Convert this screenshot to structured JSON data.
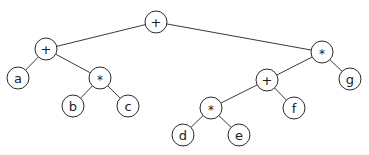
{
  "diagram": {
    "type": "expression-tree",
    "node_radius": 11,
    "colors": {
      "edge": "#3a3a3a",
      "node_stroke": "#2a2a2a",
      "node_fill": "#ffffff",
      "text": "#222222"
    },
    "nodes": [
      {
        "id": "n0",
        "label": "+",
        "x": 156,
        "y": 22
      },
      {
        "id": "n1",
        "label": "+",
        "x": 46,
        "y": 49
      },
      {
        "id": "n2",
        "label": "a",
        "x": 18,
        "y": 78
      },
      {
        "id": "n3",
        "label": "*",
        "x": 100,
        "y": 78
      },
      {
        "id": "n4",
        "label": "b",
        "x": 73,
        "y": 106
      },
      {
        "id": "n5",
        "label": "c",
        "x": 128,
        "y": 106
      },
      {
        "id": "n6",
        "label": "*",
        "x": 322,
        "y": 52
      },
      {
        "id": "n7",
        "label": "+",
        "x": 267,
        "y": 80
      },
      {
        "id": "n8",
        "label": "g",
        "x": 350,
        "y": 79
      },
      {
        "id": "n9",
        "label": "*",
        "x": 211,
        "y": 108
      },
      {
        "id": "n10",
        "label": "f",
        "x": 294,
        "y": 108
      },
      {
        "id": "n11",
        "label": "d",
        "x": 183,
        "y": 135
      },
      {
        "id": "n12",
        "label": "e",
        "x": 239,
        "y": 135
      }
    ],
    "edges": [
      [
        "n0",
        "n1"
      ],
      [
        "n0",
        "n6"
      ],
      [
        "n1",
        "n2"
      ],
      [
        "n1",
        "n3"
      ],
      [
        "n3",
        "n4"
      ],
      [
        "n3",
        "n5"
      ],
      [
        "n6",
        "n7"
      ],
      [
        "n6",
        "n8"
      ],
      [
        "n7",
        "n9"
      ],
      [
        "n7",
        "n10"
      ],
      [
        "n9",
        "n11"
      ],
      [
        "n9",
        "n12"
      ]
    ]
  }
}
